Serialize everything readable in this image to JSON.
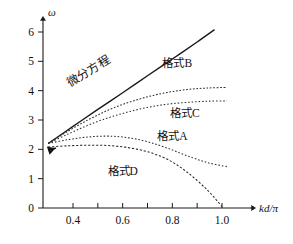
{
  "chart_data": {
    "type": "line",
    "title": "",
    "xlabel": "kd/π",
    "ylabel": "ω",
    "xlim": [
      0.3,
      1.08
    ],
    "ylim": [
      0,
      6.6
    ],
    "grid": false,
    "legend": "inline-labels",
    "x_ticks": [
      {
        "value": 0.4,
        "label": "0.4",
        "major": true
      },
      {
        "value": 0.5,
        "label": "",
        "major": false
      },
      {
        "value": 0.6,
        "label": "0.6",
        "major": true
      },
      {
        "value": 0.7,
        "label": "",
        "major": false
      },
      {
        "value": 0.8,
        "label": "0.8",
        "major": true
      },
      {
        "value": 0.9,
        "label": "",
        "major": false
      },
      {
        "value": 1.0,
        "label": "1.0",
        "major": true
      }
    ],
    "y_ticks": [
      {
        "value": 0,
        "label": "0"
      },
      {
        "value": 1,
        "label": "1"
      },
      {
        "value": 2,
        "label": "2"
      },
      {
        "value": 3,
        "label": "3"
      },
      {
        "value": 4,
        "label": "4"
      },
      {
        "value": 5,
        "label": "5"
      },
      {
        "value": 6,
        "label": "6"
      }
    ],
    "common_start": {
      "x": 0.3,
      "y": 2.2
    },
    "series": [
      {
        "name": "微分方程",
        "style": "solid",
        "label": "微分方程",
        "label_rotation": -31,
        "label_x": 0.47,
        "label_y": 4.55,
        "x": [
          0.3,
          0.4,
          0.5,
          0.6,
          0.7,
          0.8,
          0.9,
          0.97
        ],
        "y": [
          2.2,
          2.78,
          3.36,
          3.93,
          4.51,
          5.08,
          5.66,
          6.08
        ]
      },
      {
        "name": "格式B",
        "style": "dotted",
        "label": "格式B",
        "label_x": 0.82,
        "label_y": 4.82,
        "x": [
          0.3,
          0.38,
          0.46,
          0.54,
          0.62,
          0.7,
          0.78,
          0.86,
          0.94,
          1.02
        ],
        "y": [
          2.2,
          2.62,
          3.0,
          3.33,
          3.59,
          3.79,
          3.94,
          4.04,
          4.09,
          4.11
        ]
      },
      {
        "name": "格式C",
        "style": "dotted",
        "label": "格式C",
        "label_x": 0.85,
        "label_y": 3.1,
        "x": [
          0.3,
          0.38,
          0.46,
          0.54,
          0.62,
          0.7,
          0.78,
          0.86,
          0.94,
          1.02
        ],
        "y": [
          2.2,
          2.52,
          2.82,
          3.07,
          3.27,
          3.43,
          3.54,
          3.6,
          3.64,
          3.65
        ]
      },
      {
        "name": "格式A",
        "style": "dotted",
        "label": "格式A",
        "label_x": 0.8,
        "label_y": 2.33,
        "x": [
          0.3,
          0.38,
          0.46,
          0.54,
          0.62,
          0.7,
          0.78,
          0.86,
          0.94,
          1.02
        ],
        "y": [
          2.2,
          2.33,
          2.42,
          2.45,
          2.4,
          2.26,
          2.04,
          1.78,
          1.55,
          1.41
        ]
      },
      {
        "name": "格式D",
        "style": "dotted",
        "label": "格式D",
        "label_x": 0.6,
        "label_y": 1.12,
        "x": [
          0.3,
          0.38,
          0.46,
          0.54,
          0.62,
          0.7,
          0.78,
          0.86,
          0.94,
          1.0
        ],
        "y": [
          2.08,
          2.12,
          2.14,
          2.13,
          2.06,
          1.92,
          1.66,
          1.22,
          0.62,
          0.05
        ]
      }
    ]
  }
}
